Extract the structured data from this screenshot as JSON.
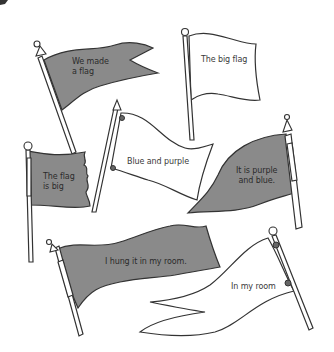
{
  "page": {
    "heading_fragment": "",
    "flag_fill_color": "#8a8a8a",
    "outline_color": "#333333",
    "background_color": "#ffffff"
  },
  "flags": [
    {
      "id": "flag-1",
      "caption": "We made\na flag",
      "line1": "We made",
      "line2": "a flag",
      "fill": "shaded"
    },
    {
      "id": "flag-2",
      "caption": "The big flag",
      "line1": "The big flag",
      "line2": "",
      "fill": "white"
    },
    {
      "id": "flag-3",
      "caption": "Blue and purple",
      "line1": "Blue and purple",
      "line2": "",
      "fill": "white"
    },
    {
      "id": "flag-4",
      "caption": "The flag\nis big",
      "line1": "The flag",
      "line2": "is big",
      "fill": "shaded"
    },
    {
      "id": "flag-5",
      "caption": "It is purple\nand blue.",
      "line1": "It is purple",
      "line2": "and blue.",
      "fill": "shaded"
    },
    {
      "id": "flag-6",
      "caption": "I hung it in my room.",
      "line1": "I hung it in my room.",
      "line2": "",
      "fill": "shaded"
    },
    {
      "id": "flag-7",
      "caption": "In my room",
      "line1": "In my room",
      "line2": "",
      "fill": "white"
    }
  ]
}
